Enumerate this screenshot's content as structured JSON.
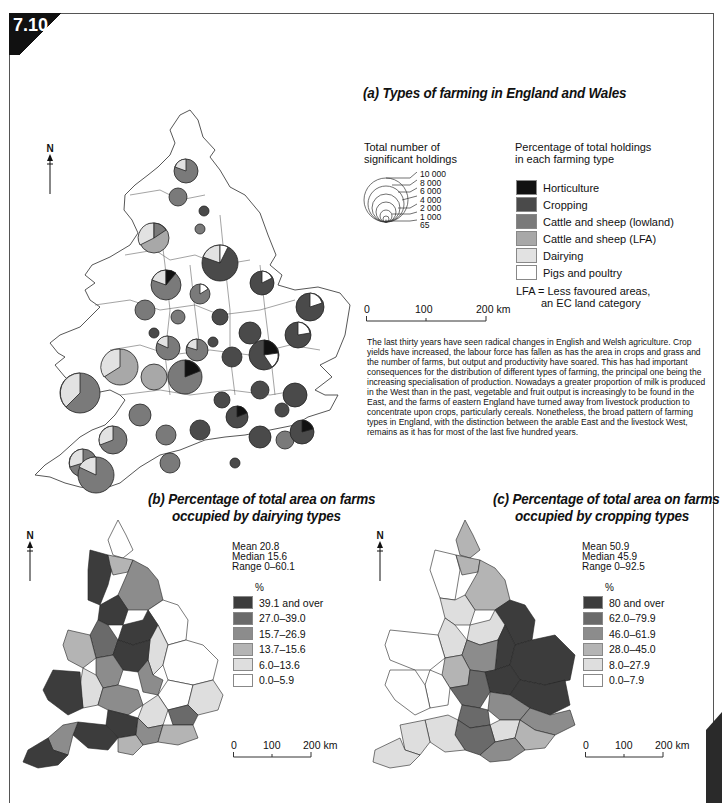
{
  "figure": {
    "number": "7.10"
  },
  "map_a": {
    "title": "(a) Types of farming in England and Wales",
    "north_label": "N",
    "size_legend": {
      "title_line1": "Total number of",
      "title_line2": "significant holdings",
      "values": [
        "10 000",
        "8 000",
        "6 000",
        "4 000",
        "2 000",
        "1 000",
        "65"
      ]
    },
    "type_legend": {
      "title_line1": "Percentage of total holdings",
      "title_line2": "in each farming type",
      "items": [
        {
          "label": "Horticulture",
          "color": "#111111"
        },
        {
          "label": "Cropping",
          "color": "#4a4a4a"
        },
        {
          "label": "Cattle and sheep (lowland)",
          "color": "#7a7a7a"
        },
        {
          "label": "Cattle and sheep (LFA)",
          "color": "#a8a8a8"
        },
        {
          "label": "Dairying",
          "color": "#e2e2e2"
        },
        {
          "label": "Pigs and poultry",
          "color": "#ffffff"
        }
      ],
      "note_line1": "LFA = Less favoured areas,",
      "note_line2": "an EC land category"
    },
    "scale": {
      "zero": "0",
      "mid": "100",
      "end": "200 km"
    }
  },
  "description": "The last thirty years have seen radical changes in English and Welsh agriculture. Crop yields have increased, the labour force has fallen as has the area in crops and grass and the number of farms, but output and productivity have soared. This has had important consequences for the distribution of different types of farming, the principal one being the increasing specialisation of production. Nowadays a greater proportion of milk is produced in the West than in the past, vegetable and fruit output is increasingly to be found in the East, and the farms of eastern England have turned away from livestock production to concentrate upon crops, particularly cereals. Nonetheless, the broad pattern of farming types in England, with the distinction between the arable East and the livestock West, remains as it has for most of the last five hundred years.",
  "map_b": {
    "title_line1": "(b) Percentage of total area on farms",
    "title_line2": "occupied by dairying types",
    "north_label": "N",
    "stats": {
      "mean": "Mean 20.8",
      "median": "Median 15.6",
      "range": "Range 0–60.1"
    },
    "unit": "%",
    "classes": [
      {
        "label": "39.1 and over",
        "color": "#3c3c3c"
      },
      {
        "label": "27.0–39.0",
        "color": "#6a6a6a"
      },
      {
        "label": "15.7–26.9",
        "color": "#8c8c8c"
      },
      {
        "label": "13.7–15.6",
        "color": "#b4b4b4"
      },
      {
        "label": "6.0–13.6",
        "color": "#dedede"
      },
      {
        "label": "0.0–5.9",
        "color": "#ffffff"
      }
    ],
    "scale": {
      "zero": "0",
      "mid": "100",
      "end": "200 km"
    }
  },
  "map_c": {
    "title_line1": "(c) Percentage of total area on farms",
    "title_line2": "occupied by cropping types",
    "north_label": "N",
    "stats": {
      "mean": "Mean 50.9",
      "median": "Median 45.9",
      "range": "Range 0–92.5"
    },
    "unit": "%",
    "classes": [
      {
        "label": "80 and over",
        "color": "#3c3c3c"
      },
      {
        "label": "62.0–79.9",
        "color": "#6a6a6a"
      },
      {
        "label": "46.0–61.9",
        "color": "#8c8c8c"
      },
      {
        "label": "28.0–45.0",
        "color": "#b4b4b4"
      },
      {
        "label": "8.0–27.9",
        "color": "#dedede"
      },
      {
        "label": "0.0–7.9",
        "color": "#ffffff"
      }
    ],
    "scale": {
      "zero": "0",
      "mid": "100",
      "end": "200 km"
    }
  }
}
